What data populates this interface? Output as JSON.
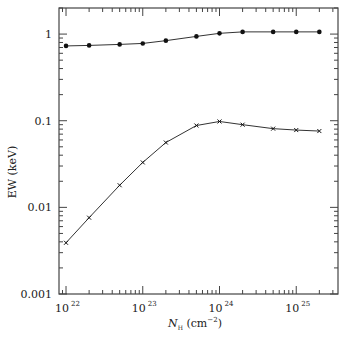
{
  "chart_data": {
    "type": "line",
    "title": "",
    "xlabel": "N_H (cm^-2)",
    "xlabel_parts": {
      "main": "N",
      "sub": "H",
      "unit_open": " (cm",
      "sup": "−2",
      "unit_close": ")"
    },
    "ylabel": "EW (keV)",
    "xscale": "log",
    "yscale": "log",
    "xlim": [
      8.1e+21,
      3.5e+25
    ],
    "ylim": [
      0.001,
      2.0
    ],
    "grid": false,
    "legend": null,
    "x_ticks": [
      {
        "value": 1e+22,
        "base": "10",
        "exp": "22"
      },
      {
        "value": 1e+23,
        "base": "10",
        "exp": "23"
      },
      {
        "value": 1e+24,
        "base": "10",
        "exp": "24"
      },
      {
        "value": 1e+25,
        "base": "10",
        "exp": "25"
      }
    ],
    "y_ticks": [
      {
        "value": 1,
        "label": "1"
      },
      {
        "value": 0.1,
        "label": "0.1"
      },
      {
        "value": 0.01,
        "label": "0.01"
      },
      {
        "value": 0.001,
        "label": "0.001"
      }
    ],
    "x": [
      1e+22,
      2e+22,
      5e+22,
      1e+23,
      2e+23,
      5e+23,
      1e+24,
      2e+24,
      5e+24,
      1e+25,
      2e+25
    ],
    "series": [
      {
        "name": "upper (filled circles)",
        "marker": "circle",
        "values": [
          0.73,
          0.74,
          0.76,
          0.78,
          0.84,
          0.94,
          1.02,
          1.06,
          1.06,
          1.06,
          1.06
        ]
      },
      {
        "name": "lower (crosses)",
        "marker": "cross",
        "values": [
          0.0039,
          0.0076,
          0.018,
          0.033,
          0.056,
          0.088,
          0.098,
          0.09,
          0.081,
          0.078,
          0.076
        ]
      }
    ]
  },
  "colors": {
    "line": "#333333",
    "axis": "#444444",
    "text": "#222222"
  }
}
